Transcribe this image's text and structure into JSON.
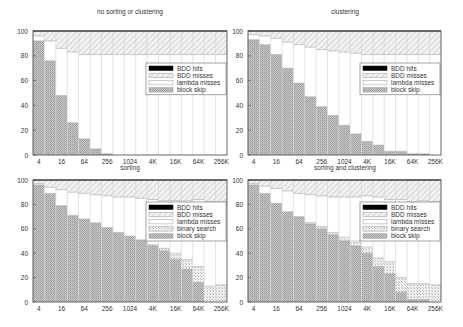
{
  "figure": {
    "panels": [
      {
        "title": "no sorting or clustering",
        "xlabel": "sorting"
      },
      {
        "title": "clustering",
        "xlabel": "sorting and clustering"
      },
      {
        "title": "",
        "xlabel": ""
      },
      {
        "title": "",
        "xlabel": ""
      }
    ]
  },
  "chart_data": [
    {
      "type": "bar",
      "stacked": true,
      "title": "no sorting or clustering",
      "xlabel": "",
      "ylabel": "",
      "ylim": [
        0,
        100
      ],
      "yticks": [
        0,
        20,
        40,
        60,
        80,
        100
      ],
      "categories": [
        "4",
        "8",
        "16",
        "32",
        "64",
        "128",
        "256",
        "512",
        "1024",
        "2K",
        "4K",
        "8K",
        "16K",
        "32K",
        "64K",
        "128K",
        "256K"
      ],
      "xtick_labels": [
        "4",
        "",
        "16",
        "",
        "64",
        "",
        "256",
        "",
        "1024",
        "",
        "4K",
        "",
        "16K",
        "",
        "64K",
        "",
        "256K"
      ],
      "legend": [
        "BDD hits",
        "BDD misses",
        "lambda misses",
        "block skip"
      ],
      "legend_position": "upper right (inside)",
      "series": [
        {
          "name": "block skip",
          "values": [
            92,
            76,
            48,
            26,
            13,
            5,
            1,
            0,
            0,
            0,
            0,
            0,
            0,
            0,
            0,
            0,
            0
          ]
        },
        {
          "name": "binary search",
          "values": [
            0,
            0,
            0,
            0,
            0,
            0,
            0,
            0,
            0,
            0,
            0,
            0,
            0,
            0,
            0,
            0,
            0
          ]
        },
        {
          "name": "lambda misses",
          "values": [
            4,
            16,
            38,
            57,
            68,
            76,
            80,
            81,
            81,
            81,
            81,
            81,
            81,
            81,
            81,
            81,
            81
          ]
        },
        {
          "name": "BDD misses",
          "values": [
            4,
            8,
            14,
            17,
            19,
            19,
            19,
            19,
            19,
            19,
            19,
            19,
            19,
            19,
            19,
            19,
            19
          ]
        },
        {
          "name": "BDD hits",
          "values": [
            0,
            0,
            0,
            0,
            0,
            0,
            0,
            0,
            0,
            0,
            0,
            0,
            0,
            0,
            0,
            0,
            0
          ]
        }
      ]
    },
    {
      "type": "bar",
      "stacked": true,
      "title": "clustering",
      "xlabel": "sorting",
      "ylabel": "",
      "ylim": [
        0,
        100
      ],
      "yticks": [
        0,
        20,
        40,
        60,
        80,
        100
      ],
      "categories": [
        "4",
        "8",
        "16",
        "32",
        "64",
        "128",
        "256",
        "512",
        "1024",
        "2K",
        "4K",
        "8K",
        "16K",
        "32K",
        "64K",
        "128K",
        "256K"
      ],
      "xtick_labels": [
        "4",
        "",
        "16",
        "",
        "64",
        "",
        "256",
        "",
        "1024",
        "",
        "4K",
        "",
        "16K",
        "",
        "64K",
        "",
        "256K"
      ],
      "legend": [
        "BDD hits",
        "BDD misses",
        "lambda misses",
        "block skip"
      ],
      "legend_position": "upper right (inside)",
      "series": [
        {
          "name": "block skip",
          "values": [
            93,
            89,
            81,
            70,
            58,
            47,
            39,
            32,
            24,
            17,
            11,
            8,
            3,
            3,
            1,
            1,
            0
          ]
        },
        {
          "name": "binary search",
          "values": [
            0,
            0,
            0,
            0,
            0,
            0,
            0,
            0,
            0,
            0,
            0,
            0,
            0,
            0,
            0,
            0,
            0
          ]
        },
        {
          "name": "lambda misses",
          "values": [
            4,
            7,
            13,
            21,
            31,
            40,
            46,
            52,
            59,
            65,
            70,
            73,
            78,
            78,
            80,
            80,
            81
          ]
        },
        {
          "name": "BDD misses",
          "values": [
            3,
            4,
            6,
            9,
            11,
            13,
            15,
            16,
            17,
            18,
            19,
            19,
            19,
            19,
            19,
            19,
            19
          ]
        },
        {
          "name": "BDD hits",
          "values": [
            0,
            0,
            0,
            0,
            0,
            0,
            0,
            0,
            0,
            0,
            0,
            0,
            0,
            0,
            0,
            0,
            0
          ]
        }
      ]
    },
    {
      "type": "bar",
      "stacked": true,
      "title": "sorting",
      "xlabel": "",
      "ylabel": "",
      "ylim": [
        0,
        100
      ],
      "yticks": [
        0,
        20,
        40,
        60,
        80,
        100
      ],
      "categories": [
        "4",
        "8",
        "16",
        "32",
        "64",
        "128",
        "256",
        "512",
        "1024",
        "2K",
        "4K",
        "8K",
        "16K",
        "32K",
        "64K",
        "128K",
        "256K"
      ],
      "xtick_labels": [
        "4",
        "",
        "16",
        "",
        "64",
        "",
        "256",
        "",
        "1024",
        "",
        "4K",
        "",
        "16K",
        "",
        "64K",
        "",
        "256K"
      ],
      "legend": [
        "BDD hits",
        "BDD misses",
        "lambda misses",
        "binary search",
        "block skip"
      ],
      "legend_position": "upper right (inside)",
      "series": [
        {
          "name": "block skip",
          "values": [
            96,
            89,
            79,
            71,
            68,
            65,
            61,
            57,
            54,
            51,
            46,
            42,
            35,
            27,
            16,
            0,
            0
          ]
        },
        {
          "name": "binary search",
          "values": [
            0,
            0,
            0,
            0,
            0,
            0,
            0,
            0,
            0,
            0,
            1,
            2,
            5,
            8,
            13,
            13,
            14
          ]
        },
        {
          "name": "lambda misses",
          "values": [
            1,
            5,
            13,
            19,
            21,
            23,
            26,
            29,
            32,
            34,
            37,
            39,
            43,
            48,
            55,
            69,
            68
          ]
        },
        {
          "name": "BDD misses",
          "values": [
            3,
            6,
            8,
            10,
            11,
            12,
            13,
            14,
            14,
            15,
            16,
            17,
            17,
            17,
            16,
            18,
            18
          ]
        },
        {
          "name": "BDD hits",
          "values": [
            0,
            0,
            0,
            0,
            0,
            0,
            0,
            0,
            0,
            0,
            0,
            0,
            0,
            0,
            0,
            0,
            0
          ]
        }
      ]
    },
    {
      "type": "bar",
      "stacked": true,
      "title": "sorting and clustering",
      "xlabel": "",
      "ylabel": "",
      "ylim": [
        0,
        100
      ],
      "yticks": [
        0,
        20,
        40,
        60,
        80,
        100
      ],
      "categories": [
        "4",
        "8",
        "16",
        "32",
        "64",
        "128",
        "256",
        "512",
        "1024",
        "2K",
        "4K",
        "8K",
        "16K",
        "32K",
        "64K",
        "128K",
        "256K"
      ],
      "xtick_labels": [
        "4",
        "",
        "16",
        "",
        "64",
        "",
        "256",
        "",
        "1024",
        "",
        "4K",
        "",
        "16K",
        "",
        "64K",
        "",
        "256K"
      ],
      "legend": [
        "BDD hits",
        "BDD misses",
        "lambda misses",
        "binary search",
        "block skip"
      ],
      "legend_position": "upper right (inside)",
      "series": [
        {
          "name": "block skip",
          "values": [
            96,
            89,
            81,
            74,
            70,
            64,
            60,
            55,
            50,
            46,
            40,
            29,
            23,
            8,
            2,
            2,
            0
          ]
        },
        {
          "name": "binary search",
          "values": [
            0,
            0,
            0,
            0,
            0,
            1,
            2,
            2,
            3,
            4,
            5,
            7,
            10,
            12,
            13,
            13,
            14
          ]
        },
        {
          "name": "lambda misses",
          "values": [
            1,
            6,
            12,
            17,
            19,
            23,
            25,
            29,
            33,
            36,
            42,
            50,
            51,
            64,
            67,
            68,
            68
          ]
        },
        {
          "name": "BDD misses",
          "values": [
            3,
            5,
            7,
            9,
            11,
            12,
            13,
            14,
            14,
            14,
            13,
            14,
            16,
            16,
            18,
            17,
            18
          ]
        },
        {
          "name": "BDD hits",
          "values": [
            0,
            0,
            0,
            0,
            0,
            0,
            0,
            0,
            0,
            0,
            0,
            0,
            0,
            0,
            0,
            0,
            0
          ]
        }
      ]
    }
  ]
}
